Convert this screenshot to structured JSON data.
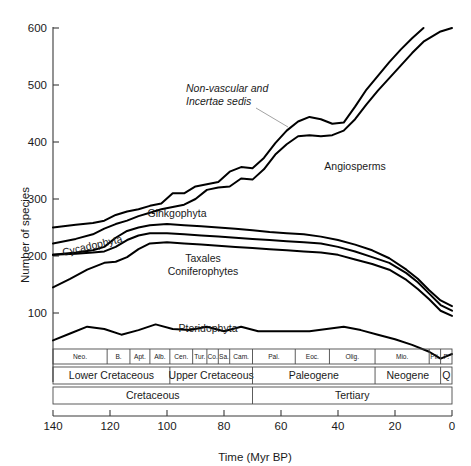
{
  "chart_data": {
    "type": "line",
    "title": "",
    "xlabel": "Time (Myr BP)",
    "ylabel": "Number of species",
    "xlim": [
      140,
      0
    ],
    "ylim": [
      0,
      600
    ],
    "x_reversed": true,
    "grid": false,
    "legend_position": "inline-annotations",
    "xticks": [
      140,
      120,
      100,
      80,
      60,
      40,
      20,
      0
    ],
    "xtick_labels": [
      "140",
      "120",
      "100",
      "80",
      "60",
      "40",
      "20",
      "0"
    ],
    "yticks": [
      100,
      200,
      300,
      400,
      500,
      600
    ],
    "ytick_labels": [
      "100",
      "200",
      "300",
      "400",
      "500",
      "600"
    ],
    "series": [
      {
        "name": "Non-vascular and Incertae sedis (upper envelope)",
        "label": "Non-vascular and\nIncertae sedis",
        "x": [
          140,
          132,
          126,
          122,
          118,
          114,
          110,
          106,
          102,
          98,
          94,
          90,
          86,
          82,
          78,
          74,
          70,
          66,
          62,
          58,
          54,
          50,
          46,
          42,
          38,
          34,
          30,
          26,
          22,
          18,
          14,
          10
        ],
        "y": [
          250,
          255,
          258,
          262,
          272,
          278,
          282,
          288,
          292,
          310,
          310,
          322,
          326,
          330,
          348,
          356,
          354,
          372,
          398,
          420,
          436,
          444,
          440,
          432,
          434,
          462,
          492,
          516,
          540,
          562,
          582,
          600
        ]
      },
      {
        "name": "Angiosperms (lower envelope)",
        "label": "Angiosperms",
        "x": [
          140,
          132,
          126,
          122,
          118,
          114,
          110,
          106,
          102,
          98,
          94,
          90,
          86,
          82,
          78,
          74,
          70,
          66,
          62,
          58,
          54,
          50,
          46,
          42,
          38,
          34,
          30,
          26,
          22,
          18,
          14,
          10,
          4,
          0
        ],
        "y": [
          222,
          230,
          238,
          248,
          256,
          262,
          270,
          276,
          282,
          286,
          290,
          300,
          316,
          320,
          322,
          336,
          334,
          352,
          378,
          396,
          410,
          412,
          410,
          412,
          420,
          440,
          466,
          490,
          512,
          534,
          556,
          576,
          594,
          600
        ]
      },
      {
        "name": "Ginkgophyta",
        "label": "Ginkgophyta",
        "x": [
          140,
          132,
          126,
          122,
          118,
          114,
          110,
          106,
          100,
          94,
          88,
          82,
          76,
          70,
          64,
          58,
          52,
          46,
          40,
          34,
          28,
          22,
          16,
          12,
          8,
          4,
          0
        ],
        "y": [
          202,
          206,
          210,
          216,
          232,
          244,
          250,
          254,
          256,
          254,
          252,
          250,
          248,
          245,
          242,
          240,
          238,
          234,
          228,
          220,
          210,
          196,
          176,
          160,
          140,
          122,
          112
        ]
      },
      {
        "name": "Cycadophyta",
        "label": "Cycadophyta",
        "x": [
          140,
          132,
          126,
          122,
          118,
          114,
          110,
          106,
          100,
          94,
          88,
          82,
          76,
          70,
          64,
          58,
          52,
          46,
          40,
          34,
          28,
          22,
          16,
          12,
          8,
          4,
          0
        ],
        "y": [
          202,
          204,
          206,
          208,
          216,
          228,
          236,
          240,
          240,
          238,
          236,
          234,
          232,
          230,
          228,
          226,
          224,
          222,
          216,
          208,
          198,
          188,
          170,
          154,
          134,
          114,
          104
        ]
      },
      {
        "name": "Taxales Coniferophytes",
        "label": "Taxales\nConiferophytes",
        "x": [
          140,
          134,
          128,
          122,
          118,
          114,
          110,
          106,
          100,
          94,
          88,
          82,
          76,
          70,
          64,
          58,
          52,
          46,
          40,
          34,
          28,
          22,
          16,
          12,
          8,
          4,
          0
        ],
        "y": [
          145,
          160,
          176,
          188,
          190,
          198,
          212,
          222,
          224,
          222,
          220,
          218,
          216,
          214,
          212,
          210,
          208,
          206,
          202,
          194,
          186,
          176,
          158,
          142,
          124,
          104,
          95
        ]
      },
      {
        "name": "Pteridophyta",
        "label": "Pteridophyta",
        "x": [
          140,
          134,
          128,
          122,
          116,
          110,
          104,
          98,
          92,
          86,
          80,
          74,
          68,
          62,
          56,
          50,
          44,
          38,
          32,
          26,
          20,
          14,
          8,
          4,
          0
        ],
        "y": [
          52,
          64,
          76,
          72,
          62,
          70,
          80,
          72,
          70,
          76,
          68,
          76,
          68,
          68,
          68,
          68,
          72,
          76,
          70,
          62,
          54,
          44,
          32,
          20,
          28
        ]
      }
    ],
    "annotations": [
      {
        "name": "non-vascular-label",
        "text": "Non-vascular and\nIncertae sedis",
        "style": "italic",
        "has_leader": true
      },
      {
        "name": "angiosperms-label",
        "text": "Angiosperms",
        "style": "normal",
        "has_leader": false
      },
      {
        "name": "ginkgophyta-label",
        "text": "Ginkgophyta",
        "style": "normal",
        "has_leader": false
      },
      {
        "name": "cycadophyta-label",
        "text": "Cycadophyta",
        "style": "normal",
        "rotated": true,
        "has_leader": false
      },
      {
        "name": "taxales-label",
        "text": "Taxales",
        "style": "normal",
        "has_leader": false
      },
      {
        "name": "coniferophytes-label",
        "text": "Coniferophytes",
        "style": "normal",
        "has_leader": false
      },
      {
        "name": "pteridophyta-label",
        "text": "Pteridophyta",
        "style": "normal",
        "has_leader": false
      }
    ],
    "stratigraphy": {
      "stages": [
        {
          "label": "Neo.",
          "from": 140,
          "to": 121
        },
        {
          "label": "B.",
          "from": 121,
          "to": 113
        },
        {
          "label": "Apt.",
          "from": 113,
          "to": 106
        },
        {
          "label": "Alb.",
          "from": 106,
          "to": 99
        },
        {
          "label": "Cen.",
          "from": 99,
          "to": 91
        },
        {
          "label": "Tur.",
          "from": 91,
          "to": 86
        },
        {
          "label": "Co.",
          "from": 86,
          "to": 82
        },
        {
          "label": "Sa.",
          "from": 82,
          "to": 78
        },
        {
          "label": "Cam.",
          "from": 78,
          "to": 70
        },
        {
          "label": "Pal.",
          "from": 70,
          "to": 55
        },
        {
          "label": "Eoc.",
          "from": 55,
          "to": 43
        },
        {
          "label": "Olig.",
          "from": 43,
          "to": 27
        },
        {
          "label": "Mio.",
          "from": 27,
          "to": 8
        },
        {
          "label": "Pli.",
          "from": 8,
          "to": 4
        },
        {
          "label": "P.",
          "from": 4,
          "to": 0
        }
      ],
      "epochs": [
        {
          "label": "Lower Cretaceous",
          "from": 140,
          "to": 99
        },
        {
          "label": "Upper Cretaceous",
          "from": 99,
          "to": 70
        },
        {
          "label": "Paleogene",
          "from": 70,
          "to": 27
        },
        {
          "label": "Neogene",
          "from": 27,
          "to": 4
        },
        {
          "label": "Q",
          "from": 4,
          "to": 0
        }
      ],
      "periods": [
        {
          "label": "Cretaceous",
          "from": 140,
          "to": 70
        },
        {
          "label": "Tertiary",
          "from": 70,
          "to": 0
        }
      ]
    }
  }
}
